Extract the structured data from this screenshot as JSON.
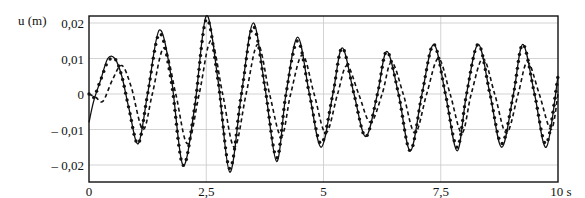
{
  "chart_data": {
    "type": "line",
    "title": "",
    "ylabel": "u (m)",
    "xlabel": "s",
    "xlim": [
      0,
      10
    ],
    "ylim": [
      -0.022,
      0.022
    ],
    "grid": true,
    "legend": null,
    "x_ticks": [
      {
        "value": 0,
        "label": "0"
      },
      {
        "value": 2.5,
        "label": "2,5"
      },
      {
        "value": 5,
        "label": "5"
      },
      {
        "value": 7.5,
        "label": "7,5"
      },
      {
        "value": 10,
        "label": "10 s"
      }
    ],
    "y_ticks": [
      {
        "value": 0.02,
        "label": "0,02"
      },
      {
        "value": 0.01,
        "label": "0,01"
      },
      {
        "value": 0,
        "label": "0"
      },
      {
        "value": -0.01,
        "label": "– 0,01"
      },
      {
        "value": -0.02,
        "label": "– 0,02"
      }
    ],
    "series": [
      {
        "name": "solid",
        "style": "solid",
        "x": [
          0,
          0.1,
          0.25,
          0.4,
          0.55,
          0.7,
          0.85,
          1.05,
          1.25,
          1.5,
          1.75,
          2.0,
          2.25,
          2.5,
          2.75,
          3.0,
          3.25,
          3.5,
          3.75,
          4.0,
          4.2,
          4.45,
          4.7,
          4.95,
          5.2,
          5.4,
          5.65,
          5.9,
          6.15,
          6.35,
          6.6,
          6.85,
          7.1,
          7.35,
          7.6,
          7.85,
          8.05,
          8.3,
          8.55,
          8.8,
          9.05,
          9.25,
          9.5,
          9.75,
          10.0
        ],
        "y": [
          -0.008,
          -0.002,
          0.004,
          0.01,
          0.01,
          0.005,
          -0.004,
          -0.014,
          0.0,
          0.018,
          0.005,
          -0.02,
          -0.004,
          0.022,
          0.004,
          -0.022,
          0.0,
          0.02,
          0.002,
          -0.019,
          0.0,
          0.016,
          0.0,
          -0.015,
          0.0,
          0.013,
          0.0,
          -0.012,
          0.0,
          0.012,
          0.0,
          -0.016,
          0.0,
          0.014,
          0.0,
          -0.016,
          0.0,
          0.014,
          0.0,
          -0.015,
          0.0,
          0.014,
          0.0,
          -0.015,
          0.005
        ]
      },
      {
        "name": "dotted-markers",
        "style": "markers",
        "x": [
          0,
          0.1,
          0.25,
          0.4,
          0.55,
          0.7,
          0.85,
          1.05,
          1.25,
          1.5,
          1.75,
          2.0,
          2.25,
          2.5,
          2.75,
          3.0,
          3.25,
          3.5,
          3.75,
          4.0,
          4.2,
          4.45,
          4.7,
          4.95,
          5.2,
          5.4,
          5.65,
          5.9,
          6.15,
          6.35,
          6.6,
          6.85,
          7.1,
          7.35,
          7.6,
          7.85,
          8.05,
          8.3,
          8.55,
          8.8,
          9.05,
          9.25,
          9.5,
          9.75,
          10.0
        ],
        "y": [
          0.0,
          -0.001,
          0.004,
          0.009,
          0.01,
          0.005,
          -0.004,
          -0.014,
          0.0,
          0.017,
          0.004,
          -0.02,
          -0.004,
          0.021,
          0.004,
          -0.021,
          0.0,
          0.019,
          0.002,
          -0.018,
          0.0,
          0.015,
          0.0,
          -0.014,
          0.0,
          0.013,
          0.0,
          -0.012,
          0.0,
          0.012,
          0.0,
          -0.016,
          0.0,
          0.014,
          0.0,
          -0.015,
          0.0,
          0.014,
          0.0,
          -0.014,
          0.0,
          0.014,
          0.0,
          -0.014,
          0.005
        ]
      },
      {
        "name": "dashed",
        "style": "dashed",
        "x": [
          0,
          0.15,
          0.3,
          0.5,
          0.7,
          0.9,
          1.15,
          1.35,
          1.6,
          1.85,
          2.1,
          2.35,
          2.6,
          2.85,
          3.1,
          3.35,
          3.6,
          3.85,
          4.1,
          4.3,
          4.55,
          4.8,
          5.05,
          5.3,
          5.5,
          5.75,
          6.0,
          6.25,
          6.45,
          6.7,
          6.95,
          7.2,
          7.45,
          7.7,
          7.95,
          8.15,
          8.4,
          8.65,
          8.9,
          9.15,
          9.35,
          9.6,
          9.85,
          10.0
        ],
        "y": [
          0.0,
          -0.001,
          -0.002,
          0.004,
          0.008,
          0.002,
          -0.01,
          0.0,
          0.013,
          0.0,
          -0.014,
          0.0,
          0.015,
          0.0,
          -0.015,
          0.0,
          0.014,
          0.0,
          -0.012,
          0.0,
          0.011,
          0.0,
          -0.011,
          0.0,
          0.008,
          0.0,
          -0.008,
          0.0,
          0.009,
          0.0,
          -0.011,
          0.0,
          0.01,
          0.0,
          -0.011,
          0.0,
          0.01,
          0.0,
          -0.011,
          0.0,
          0.009,
          0.0,
          -0.01,
          0.0
        ]
      }
    ]
  }
}
